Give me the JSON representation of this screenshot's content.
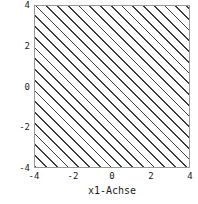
{
  "chart_data": {
    "type": "area",
    "title": "",
    "xlabel": "x1-Achse",
    "ylabel": "x2-Achse",
    "xlim": [
      -4,
      4
    ],
    "ylim": [
      -4,
      4
    ],
    "xticks": [
      "-4",
      "-2",
      "0",
      "2",
      "4"
    ],
    "xtick_values": [
      -4,
      -2,
      0,
      2,
      4
    ],
    "yticks": [
      "4",
      "2",
      "0",
      "-2",
      "-4"
    ],
    "ytick_values": [
      4,
      2,
      0,
      -2,
      -4
    ],
    "grid": false,
    "legend": null,
    "annotations": [],
    "regions": [
      {
        "name": "hatched-region",
        "fill": "diagonal-hatch",
        "hatch_angle_deg": 45,
        "hatch_spacing_px": 8,
        "hatch_color": "#3b3b3b",
        "background": "#ffffff",
        "covers": "entire-axes",
        "x_range": [
          -4,
          4
        ],
        "y_range": [
          -4,
          4
        ]
      }
    ],
    "frame_color": "#9a9a9a"
  },
  "axes": {
    "x": {
      "label": "x1-Achse",
      "ticks": [
        {
          "label": "-4",
          "pos_pct": 0
        },
        {
          "label": "-2",
          "pos_pct": 25
        },
        {
          "label": "0",
          "pos_pct": 50
        },
        {
          "label": "2",
          "pos_pct": 75
        },
        {
          "label": "4",
          "pos_pct": 100
        }
      ]
    },
    "y": {
      "label": "x2-Achse",
      "ticks": [
        {
          "label": "4",
          "pos_pct": 0
        },
        {
          "label": "2",
          "pos_pct": 25
        },
        {
          "label": "0",
          "pos_pct": 50
        },
        {
          "label": "-2",
          "pos_pct": 75
        },
        {
          "label": "-4",
          "pos_pct": 100
        }
      ]
    }
  }
}
